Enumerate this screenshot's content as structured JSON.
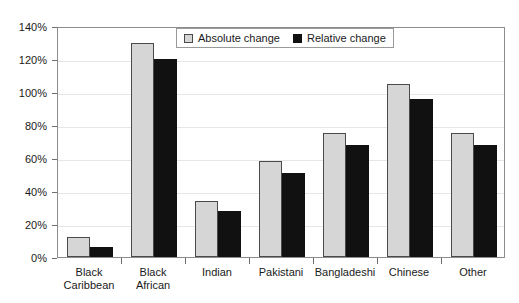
{
  "chart_data": {
    "type": "bar",
    "title": "",
    "subtitle": "",
    "xlabel": "",
    "ylabel": "",
    "ylim": [
      0,
      140
    ],
    "y_ticks": [
      0,
      20,
      40,
      60,
      80,
      100,
      120,
      140
    ],
    "y_tick_labels": [
      "0%",
      "20%",
      "40%",
      "60%",
      "80%",
      "100%",
      "120%",
      "140%"
    ],
    "grid": true,
    "legend_position": "upper center",
    "categories": [
      "Black Caribbean",
      "Black African",
      "Indian",
      "Pakistani",
      "Bangladeshi",
      "Chinese",
      "Other"
    ],
    "category_lines": [
      [
        "Black",
        "Caribbean"
      ],
      [
        "Black",
        "African"
      ],
      [
        "Indian"
      ],
      [
        "Pakistani"
      ],
      [
        "Bangladeshi"
      ],
      [
        "Chinese"
      ],
      [
        "Other"
      ]
    ],
    "series": [
      {
        "name": "Absolute change",
        "color": "#d6d6d6",
        "values": [
          12,
          130,
          34,
          58,
          75,
          105,
          75
        ]
      },
      {
        "name": "Relative change",
        "color": "#111111",
        "values": [
          6,
          120,
          28,
          51,
          68,
          96,
          68
        ]
      }
    ]
  },
  "legend": {
    "entries": [
      {
        "label": "Absolute change"
      },
      {
        "label": "Relative change"
      }
    ]
  },
  "colors": {
    "absolute": "#d6d6d6",
    "relative": "#111111",
    "axis": "#8c8c8c",
    "grid": "#e6e6e6",
    "text": "#1a1a1a",
    "background": "#ffffff"
  }
}
